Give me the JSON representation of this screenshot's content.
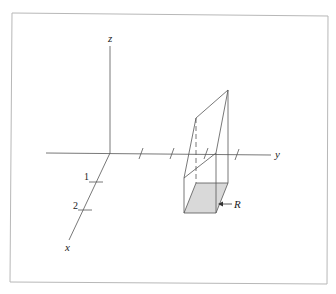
{
  "figure": {
    "frame_color": "#b8b8b8",
    "line_color": "#555555",
    "shade_color": "#d9d9d9",
    "axes": {
      "x": {
        "label": "x",
        "ticks": [
          "1",
          "2"
        ]
      },
      "y": {
        "label": "y",
        "tick_count": 4
      },
      "z": {
        "label": "z"
      }
    },
    "region": {
      "label": "R",
      "description": "Rectangular region in the xy-plane beneath a solid"
    }
  }
}
